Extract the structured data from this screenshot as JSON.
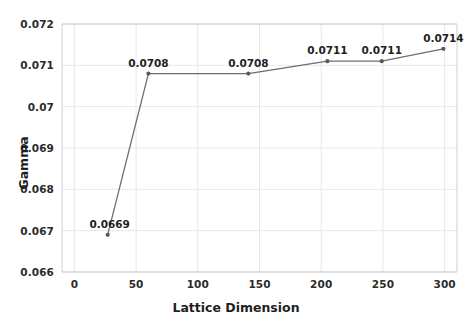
{
  "chart_data": {
    "type": "line",
    "title": "",
    "xlabel": "Lattice Dimension",
    "ylabel": "Gamma",
    "x": [
      27,
      60,
      141,
      205,
      249,
      299
    ],
    "values": [
      0.0669,
      0.0708,
      0.0708,
      0.0711,
      0.0711,
      0.0714
    ],
    "point_labels": [
      "0.0669",
      "0.0708",
      "0.0708",
      "0.0711",
      "0.0711",
      "0.0714"
    ],
    "xlim": [
      -10,
      310
    ],
    "ylim": [
      0.066,
      0.072
    ],
    "xticks": [
      0,
      50,
      100,
      150,
      200,
      250,
      300
    ],
    "xtick_labels": [
      "0",
      "50",
      "100",
      "150",
      "200",
      "250",
      "300"
    ],
    "yticks": [
      0.066,
      0.067,
      0.068,
      0.069,
      0.07,
      0.071,
      0.072
    ],
    "ytick_labels": [
      "0.066",
      "0.067",
      "0.068",
      "0.069",
      "0.07",
      "0.071",
      "0.072"
    ],
    "grid": true,
    "legend": null,
    "series_color": "#6e6e6e",
    "marker_color": "#5a5a5a",
    "grid_color": "#e8e8e8",
    "axis_color": "#cfcfcf"
  }
}
